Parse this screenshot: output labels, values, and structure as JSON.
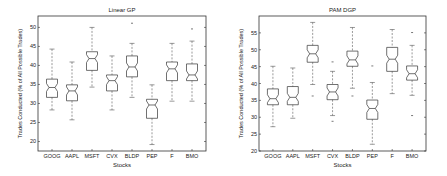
{
  "chart_data": [
    {
      "type": "boxplot",
      "title": "Linear GP",
      "xlabel": "Stocks",
      "ylabel": "Trades Conducted (% of All Possible Trades)",
      "ylim": [
        17.5,
        53
      ],
      "yticks": [
        20,
        25,
        30,
        35,
        40,
        45,
        50
      ],
      "grid": false,
      "notched": true,
      "categories": [
        "GOOG",
        "AAPL",
        "MSFT",
        "CVX",
        "BLDP",
        "PEP",
        "F",
        "BMO"
      ],
      "boxes": [
        {
          "label": "GOOG",
          "whisker_low": 28.3,
          "q1": 31.6,
          "median": 34.2,
          "q3": 36.4,
          "whisker_high": 44.3,
          "outliers": []
        },
        {
          "label": "AAPL",
          "whisker_low": 25.7,
          "q1": 30.7,
          "median": 33.3,
          "q3": 34.9,
          "whisker_high": 40.9,
          "outliers": []
        },
        {
          "label": "MSFT",
          "whisker_low": 34.3,
          "q1": 38.7,
          "median": 41.8,
          "q3": 43.6,
          "whisker_high": 50.0,
          "outliers": []
        },
        {
          "label": "CVX",
          "whisker_low": 28.3,
          "q1": 33.3,
          "median": 36.0,
          "q3": 37.5,
          "whisker_high": 42.5,
          "outliers": []
        },
        {
          "label": "BLDP",
          "whisker_low": 31.6,
          "q1": 37.0,
          "median": 39.6,
          "q3": 42.5,
          "whisker_high": 45.8,
          "outliers": [
            51.1
          ]
        },
        {
          "label": "PEP",
          "whisker_low": 19.2,
          "q1": 26.1,
          "median": 29.6,
          "q3": 31.1,
          "whisker_high": 34.9,
          "outliers": []
        },
        {
          "label": "F",
          "whisker_low": 30.6,
          "q1": 36.0,
          "median": 39.1,
          "q3": 40.9,
          "whisker_high": 45.8,
          "outliers": []
        },
        {
          "label": "BMO",
          "whisker_low": 30.6,
          "q1": 36.0,
          "median": 37.5,
          "q3": 40.4,
          "whisker_high": 46.4,
          "outliers": [
            49.6
          ]
        }
      ],
      "frame": {
        "x0": 38,
        "y0": 16,
        "x1": 206,
        "y1": 151
      }
    },
    {
      "type": "boxplot",
      "title": "PAM DGP",
      "xlabel": "Stocks",
      "ylabel": "Trades Conducted (% of All Possible Trades)",
      "ylim": [
        20,
        60
      ],
      "yticks": [
        20,
        25,
        30,
        35,
        40,
        45,
        50,
        55
      ],
      "grid": false,
      "notched": true,
      "categories": [
        "GOOG",
        "AAPL",
        "MSFT",
        "CVX",
        "BLDP",
        "PEP",
        "F",
        "BMO"
      ],
      "boxes": [
        {
          "label": "GOOG",
          "whisker_low": 27.2,
          "q1": 33.7,
          "median": 35.5,
          "q3": 38.4,
          "whisker_high": 45.1,
          "outliers": []
        },
        {
          "label": "AAPL",
          "whisker_low": 29.7,
          "q1": 33.7,
          "median": 35.9,
          "q3": 39.1,
          "whisker_high": 44.6,
          "outliers": []
        },
        {
          "label": "MSFT",
          "whisker_low": 39.7,
          "q1": 46.3,
          "median": 48.8,
          "q3": 51.3,
          "whisker_high": 58.1,
          "outliers": [
            36.3
          ]
        },
        {
          "label": "CVX",
          "whisker_low": 30.5,
          "q1": 35.2,
          "median": 37.5,
          "q3": 39.7,
          "whisker_high": 43.6,
          "outliers": [
            46.4,
            28.8
          ]
        },
        {
          "label": "BLDP",
          "whisker_low": 38.6,
          "q1": 45.1,
          "median": 47.0,
          "q3": 49.6,
          "whisker_high": 56.6,
          "outliers": [
            36.3
          ]
        },
        {
          "label": "PEP",
          "whisker_low": 22.0,
          "q1": 29.4,
          "median": 32.6,
          "q3": 35.1,
          "whisker_high": 40.3,
          "outliers": [
            45.2
          ]
        },
        {
          "label": "F",
          "whisker_low": 37.0,
          "q1": 43.6,
          "median": 47.2,
          "q3": 50.7,
          "whisker_high": 56.0,
          "outliers": []
        },
        {
          "label": "BMO",
          "whisker_low": 36.5,
          "q1": 41.0,
          "median": 42.9,
          "q3": 45.2,
          "whisker_high": 51.3,
          "outliers": [
            55.1,
            30.5
          ]
        }
      ],
      "frame": {
        "x0": 259,
        "y0": 16,
        "x1": 426,
        "y1": 151
      }
    }
  ],
  "colors": {
    "box": "#333333",
    "whisker": "#555555",
    "outlier": "#555555",
    "axis": "#333333",
    "text": "#222222",
    "background": "#ffffff"
  }
}
